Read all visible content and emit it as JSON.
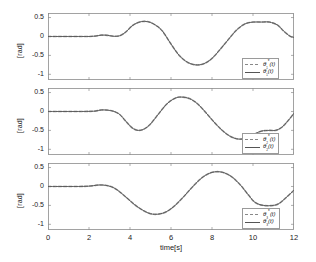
{
  "figure": {
    "width": 316,
    "height": 262,
    "background": "#ffffff",
    "axis_color": "#8c8c8c",
    "ref_color": "#9a9a9a",
    "actual_color": "#555555"
  },
  "axes": {
    "xlabel": "time[s]",
    "ylabel": "[rad]",
    "xticks": [
      0,
      2,
      4,
      6,
      8,
      10,
      12
    ],
    "xtick_labels": [
      "0",
      "2",
      "4",
      "6",
      "8",
      "10",
      "12"
    ],
    "yticks": [
      0.5,
      0,
      -0.5,
      -1
    ],
    "ytick_labels": [
      "0.5",
      "0",
      "-0.5",
      "-1"
    ],
    "xlim": [
      0,
      12
    ],
    "ylim": [
      -1.15,
      0.62
    ],
    "grid": false
  },
  "chart_data": {
    "type": "line",
    "title": "",
    "xlabel": "time[s]",
    "ylabel": "[rad]",
    "xlim": [
      0,
      12
    ],
    "ylim": [
      -1.15,
      0.62
    ],
    "grid": false,
    "panels": [
      {
        "index": 1,
        "legend_position": "lower-right",
        "legend": [
          "θ₁*(t)",
          "θ₁(t)"
        ],
        "series": [
          {
            "name": "θ₁*(t)",
            "style": "dashed",
            "color": "#9a9a9a",
            "x": [
              0,
              0.5,
              1,
              1.5,
              2,
              2.3,
              2.6,
              2.9,
              3.2,
              3.5,
              3.8,
              4.1,
              4.4,
              4.7,
              5,
              5.3,
              5.6,
              6,
              6.4,
              6.8,
              7.2,
              7.6,
              8,
              8.4,
              8.8,
              9.2,
              9.6,
              10,
              10.4,
              10.8,
              11.2,
              11.5,
              11.8,
              12
            ],
            "y": [
              0,
              0,
              0,
              0,
              0,
              0.01,
              0.035,
              0.03,
              0.005,
              0.02,
              0.12,
              0.28,
              0.37,
              0.4,
              0.37,
              0.28,
              0.13,
              -0.2,
              -0.5,
              -0.68,
              -0.75,
              -0.72,
              -0.58,
              -0.34,
              -0.08,
              0.17,
              0.33,
              0.38,
              0.38,
              0.38,
              0.3,
              0.14,
              0.01,
              -0.03
            ]
          },
          {
            "name": "θ₁(t)",
            "style": "solid",
            "color": "#555555",
            "x": [
              0,
              0.5,
              1,
              1.5,
              2,
              2.3,
              2.6,
              2.9,
              3.2,
              3.5,
              3.8,
              4.1,
              4.4,
              4.7,
              5,
              5.3,
              5.6,
              6,
              6.4,
              6.8,
              7.2,
              7.6,
              8,
              8.4,
              8.8,
              9.2,
              9.6,
              10,
              10.4,
              10.8,
              11.2,
              11.5,
              11.8,
              12
            ],
            "y": [
              0,
              0,
              0,
              0,
              0,
              0.01,
              0.035,
              0.03,
              0.005,
              0.02,
              0.12,
              0.28,
              0.37,
              0.4,
              0.37,
              0.28,
              0.13,
              -0.2,
              -0.5,
              -0.68,
              -0.75,
              -0.72,
              -0.58,
              -0.34,
              -0.08,
              0.17,
              0.33,
              0.38,
              0.38,
              0.38,
              0.3,
              0.14,
              0.01,
              -0.03
            ]
          }
        ]
      },
      {
        "index": 2,
        "legend_position": "lower-right",
        "legend": [
          "θ₂*(t)",
          "θ₂(t)"
        ],
        "series": [
          {
            "name": "θ₂*(t)",
            "style": "dashed",
            "color": "#9a9a9a",
            "x": [
              0,
              0.5,
              1,
              1.5,
              2,
              2.3,
              2.6,
              2.9,
              3.2,
              3.5,
              3.8,
              4.1,
              4.4,
              4.7,
              5,
              5.4,
              5.8,
              6.2,
              6.5,
              6.9,
              7.3,
              7.7,
              8.1,
              8.5,
              8.9,
              9.3,
              9.7,
              10,
              10.4,
              10.8,
              11.1,
              11.4,
              11.7,
              12
            ],
            "y": [
              0,
              0,
              0,
              0,
              0.002,
              0.01,
              0.04,
              0.035,
              0.005,
              -0.08,
              -0.26,
              -0.43,
              -0.5,
              -0.46,
              -0.33,
              -0.06,
              0.2,
              0.35,
              0.38,
              0.34,
              0.2,
              -0.03,
              -0.28,
              -0.5,
              -0.66,
              -0.73,
              -0.7,
              -0.62,
              -0.52,
              -0.5,
              -0.5,
              -0.42,
              -0.25,
              -0.05
            ]
          },
          {
            "name": "θ₂(t)",
            "style": "solid",
            "color": "#555555",
            "x": [
              0,
              0.5,
              1,
              1.5,
              2,
              2.3,
              2.6,
              2.9,
              3.2,
              3.5,
              3.8,
              4.1,
              4.4,
              4.7,
              5,
              5.4,
              5.8,
              6.2,
              6.5,
              6.9,
              7.3,
              7.7,
              8.1,
              8.5,
              8.9,
              9.3,
              9.7,
              10,
              10.4,
              10.8,
              11.1,
              11.4,
              11.7,
              12
            ],
            "y": [
              0,
              0,
              0,
              0,
              0.002,
              0.01,
              0.04,
              0.035,
              0.005,
              -0.08,
              -0.26,
              -0.43,
              -0.5,
              -0.46,
              -0.33,
              -0.06,
              0.2,
              0.35,
              0.38,
              0.34,
              0.2,
              -0.03,
              -0.28,
              -0.5,
              -0.66,
              -0.73,
              -0.7,
              -0.62,
              -0.52,
              -0.5,
              -0.5,
              -0.42,
              -0.25,
              -0.05
            ]
          }
        ]
      },
      {
        "index": 3,
        "legend_position": "lower-right",
        "legend": [
          "θ₃*(t)",
          "θ₃(t)"
        ],
        "series": [
          {
            "name": "θ₃*(t)",
            "style": "dashed",
            "color": "#9a9a9a",
            "x": [
              0,
              0.5,
              1,
              1.5,
              1.9,
              2.2,
              2.5,
              2.8,
              3.1,
              3.4,
              3.8,
              4.2,
              4.6,
              5,
              5.4,
              5.8,
              6.2,
              6.6,
              7,
              7.4,
              7.8,
              8.2,
              8.6,
              9,
              9.4,
              9.8,
              10.1,
              10.5,
              11,
              11.3,
              11.6,
              12
            ],
            "y": [
              0,
              0,
              0,
              0,
              0.005,
              0.02,
              0.04,
              0.03,
              -0.01,
              -0.1,
              -0.28,
              -0.47,
              -0.62,
              -0.72,
              -0.73,
              -0.66,
              -0.5,
              -0.28,
              -0.04,
              0.18,
              0.33,
              0.39,
              0.36,
              0.24,
              0.03,
              -0.24,
              -0.42,
              -0.5,
              -0.5,
              -0.44,
              -0.3,
              -0.1
            ]
          },
          {
            "name": "θ₃(t)",
            "style": "solid",
            "color": "#555555",
            "x": [
              0,
              0.5,
              1,
              1.5,
              1.9,
              2.2,
              2.5,
              2.8,
              3.1,
              3.4,
              3.8,
              4.2,
              4.6,
              5,
              5.4,
              5.8,
              6.2,
              6.6,
              7,
              7.4,
              7.8,
              8.2,
              8.6,
              9,
              9.4,
              9.8,
              10.1,
              10.5,
              11,
              11.3,
              11.6,
              12
            ],
            "y": [
              0,
              0,
              0,
              0,
              0.005,
              0.02,
              0.04,
              0.03,
              -0.01,
              -0.1,
              -0.28,
              -0.47,
              -0.62,
              -0.72,
              -0.73,
              -0.66,
              -0.5,
              -0.28,
              -0.04,
              0.18,
              0.33,
              0.39,
              0.36,
              0.24,
              0.03,
              -0.24,
              -0.42,
              -0.5,
              -0.5,
              -0.44,
              -0.3,
              -0.1
            ]
          }
        ]
      }
    ]
  }
}
